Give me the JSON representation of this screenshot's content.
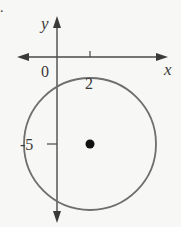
{
  "problem_marker": ".",
  "axes": {
    "x_label": "x",
    "y_label": "y",
    "origin_label": "0"
  },
  "ticks": {
    "x_tick_label": "2",
    "y_tick_label": "-5"
  },
  "circle": {
    "center": [
      2,
      -5
    ],
    "radius_units": "passes near origin",
    "stroke_color": "#6e6e6e"
  },
  "colors": {
    "axis": "#4a4a4a",
    "background": "#f7f7f5",
    "center_point": "#111111"
  }
}
